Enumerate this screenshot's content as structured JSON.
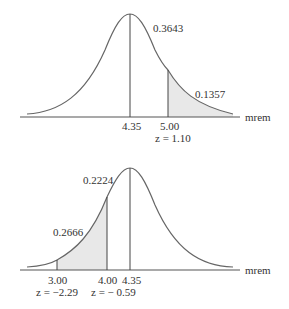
{
  "panels": [
    {
      "id": "top",
      "mean_label": "4.35",
      "cut_label": "5.00",
      "z_label": "z = 1.10",
      "area_center_label": "0.3643",
      "area_tail_label": "0.1357",
      "axis_unit": "mrem"
    },
    {
      "id": "bottom",
      "left_label": "3.00",
      "right_label": "4.00",
      "mean_label": "4.35",
      "z_left_label": "z = −2.29",
      "z_right_label": "z = − 0.59",
      "area_center_label": "0.2224",
      "area_shaded_label": "0.2666",
      "axis_unit": "mrem"
    }
  ],
  "colors": {
    "curve": "#666666",
    "axis": "#555555",
    "shade": "#e8e8e8",
    "text": "#333333"
  }
}
